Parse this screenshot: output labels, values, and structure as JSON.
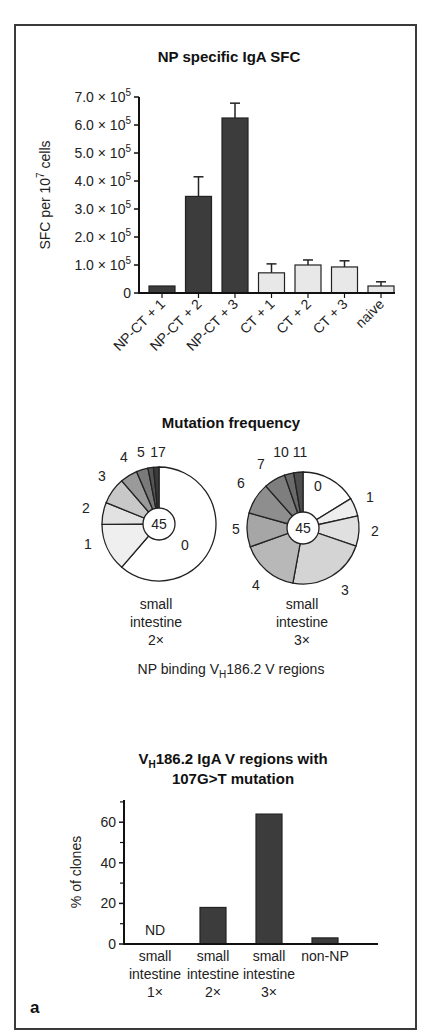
{
  "figure": {
    "panel_label": "a",
    "frame_color": "#3a3a3a"
  },
  "chart_data": [
    {
      "type": "bar",
      "title": "NP specific IgA SFC",
      "xlabel": "",
      "ylabel": "SFC per 10^7 cells",
      "ylabel_parts": {
        "main": "SFC per 10",
        "sup": "7",
        "tail": " cells"
      },
      "ylim": [
        0,
        700000
      ],
      "yticks": [
        {
          "value": 0,
          "label": "0"
        },
        {
          "value": 100000,
          "mantissa": "1.0",
          "exp": "5"
        },
        {
          "value": 200000,
          "mantissa": "2.0",
          "exp": "5"
        },
        {
          "value": 300000,
          "mantissa": "3.0",
          "exp": "5"
        },
        {
          "value": 400000,
          "mantissa": "4.0",
          "exp": "5"
        },
        {
          "value": 500000,
          "mantissa": "5.0",
          "exp": "5"
        },
        {
          "value": 600000,
          "mantissa": "6.0",
          "exp": "5"
        },
        {
          "value": 700000,
          "mantissa": "7.0",
          "exp": "5"
        }
      ],
      "categories": [
        "NP-CT + 1",
        "NP-CT + 2",
        "NP-CT + 3",
        "CT + 1",
        "CT + 2",
        "CT + 3",
        "naive"
      ],
      "values": [
        25000,
        345000,
        625000,
        72000,
        100000,
        93000,
        25000
      ],
      "error_upper": [
        25000,
        415000,
        678000,
        104000,
        118000,
        115000,
        40000
      ],
      "bar_colors": [
        "#3c3c3c",
        "#3c3c3c",
        "#3c3c3c",
        "#e8e8e8",
        "#e8e8e8",
        "#e8e8e8",
        "#e8e8e8"
      ],
      "grid": false,
      "legend": null
    },
    {
      "type": "pie",
      "title": "Mutation frequency",
      "subtitle": "NP binding VH186.2 V regions",
      "subtitle_parts": {
        "pre": "NP binding V",
        "sub": "H",
        "post": "186.2 V regions"
      },
      "center_label": "45",
      "caption_lines": [
        "small",
        "intestine",
        "2×"
      ],
      "categories": [
        "0",
        "1",
        "2",
        "3",
        "4",
        "5",
        "6",
        "17"
      ],
      "values": [
        27.6,
        6.1,
        2.8,
        3.4,
        2.2,
        1.5,
        0.7,
        0.7
      ],
      "slice_colors": [
        "#ffffff",
        "#efefef",
        "#e2e2e2",
        "#c8c8c8",
        "#9a9a9a",
        "#7a7a7a",
        "#555555",
        "#3a3a3a"
      ],
      "visible_labels": [
        "0",
        "1",
        "2",
        "3",
        "4",
        "5",
        "17"
      ]
    },
    {
      "type": "pie",
      "title": "Mutation frequency",
      "center_label": "45",
      "caption_lines": [
        "small",
        "intestine",
        "3×"
      ],
      "categories": [
        "0",
        "1",
        "2",
        "3",
        "4",
        "5",
        "6",
        "7",
        "10",
        "11"
      ],
      "values": [
        7.3,
        2.4,
        3.9,
        10.2,
        7.5,
        4.4,
        4.1,
        2.8,
        1.2,
        1.2
      ],
      "slice_colors": [
        "#ffffff",
        "#eeeeee",
        "#e0e0e0",
        "#d4d4d4",
        "#b8b8b8",
        "#a6a6a6",
        "#8e8e8e",
        "#7e7e7e",
        "#6a6a6a",
        "#4e4e4e"
      ],
      "visible_labels": [
        "0",
        "1",
        "2",
        "3",
        "4",
        "5",
        "6",
        "7",
        "10",
        "11"
      ]
    },
    {
      "type": "bar",
      "title": "VH186.2 IgA V regions with 107G>T mutation",
      "title_parts": {
        "pre": "V",
        "sub": "H",
        "post": "186.2 IgA V regions with",
        "line2": "107G>T mutation"
      },
      "xlabel": "",
      "ylabel": "% of clones",
      "ylim": [
        0,
        70
      ],
      "yticks": [
        0,
        20,
        40,
        60
      ],
      "minor_yticks": [
        10,
        30,
        50,
        70
      ],
      "categories": [
        "small intestine 1×",
        "small intestine 2×",
        "small intestine 3×",
        "non-NP"
      ],
      "category_lines": [
        [
          "small",
          "intestine",
          "1×"
        ],
        [
          "small",
          "intestine",
          "2×"
        ],
        [
          "small",
          "intestine",
          "3×"
        ],
        [
          "non-NP"
        ]
      ],
      "values": [
        null,
        18,
        64,
        3
      ],
      "annotations": [
        {
          "category": "small intestine 1×",
          "text": "ND"
        }
      ],
      "bar_color": "#3c3c3c",
      "grid": false,
      "legend": null
    }
  ]
}
